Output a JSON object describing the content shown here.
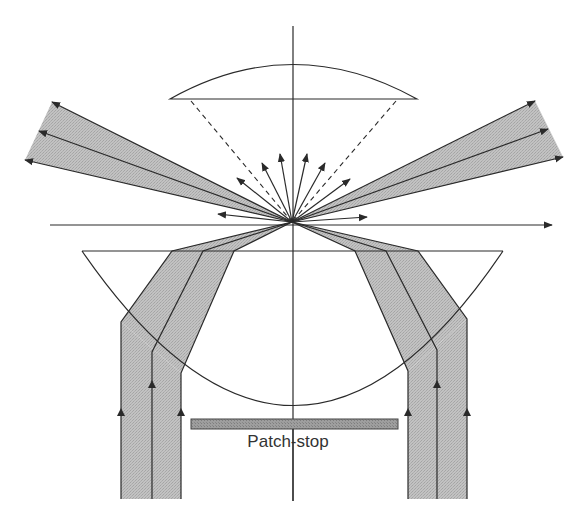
{
  "diagram": {
    "labels": {
      "patch_stop": "Patch-stop"
    },
    "colors": {
      "line": "#2a2a2a",
      "beam_fill": "#bdbdbd",
      "patch_stop_fill": "#9a9a9a",
      "background": "#ffffff"
    },
    "elements": {
      "upper_lens": "objective lens (plano-convex, upper)",
      "lower_lens": "condenser lens (plano-convex, lower)",
      "optical_axis": "vertical optical axis",
      "specimen_plane": "horizontal specimen plane",
      "incident_beams": [
        "left annular beam",
        "right annular beam"
      ],
      "transmitted_beams": [
        "left exiting cone",
        "right exiting cone"
      ],
      "scattered_rays_count": 8,
      "acceptance_cone": "dashed lines from focal point to upper lens edges"
    }
  }
}
